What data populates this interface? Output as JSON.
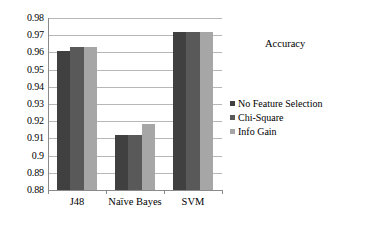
{
  "chart_data": {
    "type": "bar",
    "title": "",
    "xlabel": "",
    "ylabel": "",
    "ylim": [
      0.88,
      0.98
    ],
    "ytick_step": 0.01,
    "grid": true,
    "legend_position": "right",
    "legend_title": "Accuracy",
    "categories": [
      "J48",
      "Naïve Bayes",
      "SVM"
    ],
    "yticks": [
      "0.98",
      "0.97",
      "0.96",
      "0.95",
      "0.94",
      "0.93",
      "0.92",
      "0.91",
      "0.9",
      "0.89",
      "0.88"
    ],
    "ytick_values": [
      0.98,
      0.97,
      0.96,
      0.95,
      0.94,
      0.93,
      0.92,
      0.91,
      0.9,
      0.89,
      0.88
    ],
    "series": [
      {
        "name": "No Feature Selection",
        "color": "#404040",
        "values": [
          0.961,
          0.912,
          0.972
        ]
      },
      {
        "name": "Chi-Square",
        "color": "#595959",
        "values": [
          0.963,
          0.912,
          0.972
        ]
      },
      {
        "name": "Info Gain",
        "color": "#a6a6a6",
        "values": [
          0.963,
          0.9185,
          0.972
        ]
      }
    ]
  },
  "legend": {
    "title": "Accuracy",
    "items": [
      {
        "label": "No Feature Selection",
        "color": "#404040"
      },
      {
        "label": "Chi-Square",
        "color": "#595959"
      },
      {
        "label": "Info Gain",
        "color": "#a6a6a6"
      }
    ]
  },
  "axes": {
    "y": {
      "ticks": [
        "0.98",
        "0.97",
        "0.96",
        "0.95",
        "0.94",
        "0.93",
        "0.92",
        "0.91",
        "0.9",
        "0.89",
        "0.88"
      ]
    },
    "x": {
      "ticks": [
        "J48",
        "Naïve Bayes",
        "SVM"
      ]
    }
  }
}
